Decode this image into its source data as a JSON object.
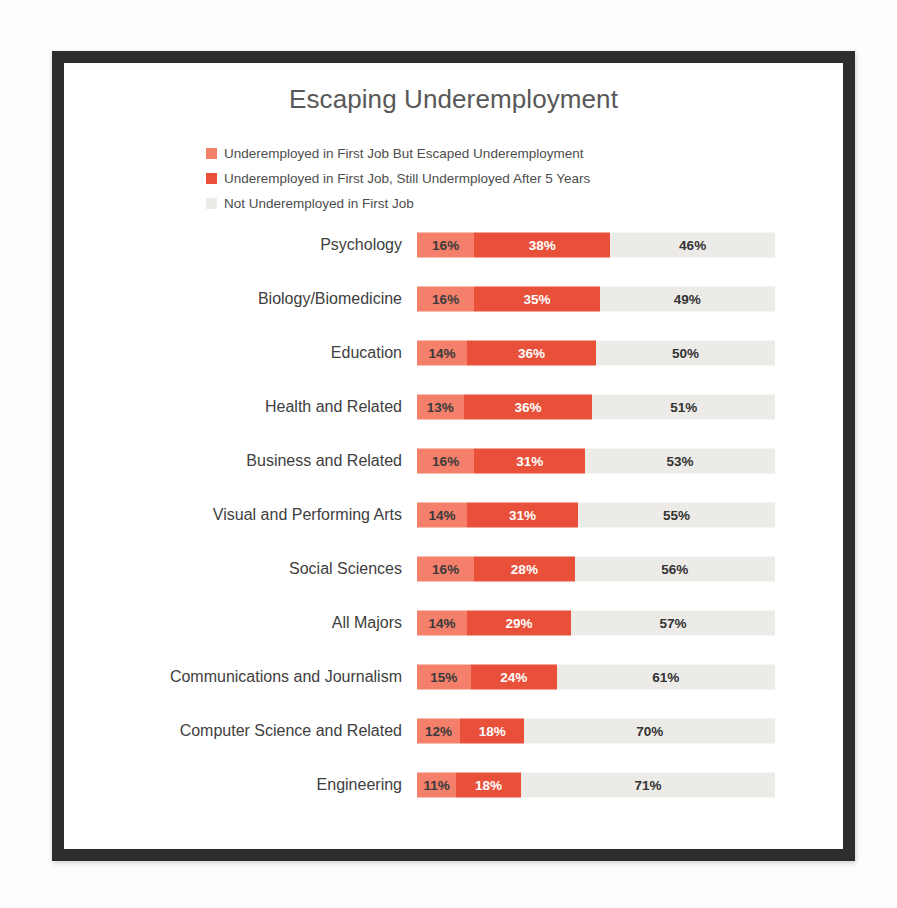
{
  "chart_data": {
    "type": "bar",
    "subtype": "stacked-horizontal-100",
    "title": "Escaping Underemployment",
    "xlabel": "",
    "ylabel": "",
    "xlim": [
      0,
      100
    ],
    "grid": false,
    "legend_position": "top-left",
    "value_suffix": "%",
    "colors": {
      "escaped": "#f4806c",
      "still": "#e8503a",
      "not": "#edebe8",
      "title_text": "#585858",
      "label_text": "#404040",
      "frame": "#2e2d2e",
      "background": "#ffffff"
    },
    "legend": [
      {
        "label": "Underemployed in First Job But Escaped Underemployment",
        "color": "#f4806c",
        "key": "escaped"
      },
      {
        "label": "Underemployed in First Job, Still Undermployed After 5 Years",
        "color": "#e8503a",
        "key": "still"
      },
      {
        "label": "Not Underemployed in First Job",
        "color": "#edebe8",
        "key": "not"
      }
    ],
    "series": [
      {
        "name": "Underemployed in First Job But Escaped Underemployment",
        "key": "escaped",
        "values": [
          16,
          16,
          14,
          13,
          16,
          14,
          16,
          14,
          15,
          12,
          11
        ]
      },
      {
        "name": "Underemployed in First Job, Still Undermployed After 5 Years",
        "key": "still",
        "values": [
          38,
          35,
          36,
          36,
          31,
          31,
          28,
          29,
          24,
          18,
          18
        ]
      },
      {
        "name": "Not Underemployed in First Job",
        "key": "not",
        "values": [
          46,
          49,
          50,
          51,
          53,
          55,
          56,
          57,
          61,
          70,
          71
        ]
      }
    ],
    "categories": [
      "Psychology",
      "Biology/Biomedicine",
      "Education",
      "Health and Related",
      "Business and Related",
      "Visual and Performing Arts",
      "Social Sciences",
      "All Majors",
      "Communications and Journalism",
      "Computer Science and Related",
      "Engineering"
    ],
    "rows": [
      {
        "category": "Psychology",
        "escaped": 16,
        "still": 38,
        "not": 46,
        "escaped_label": "16%",
        "still_label": "38%",
        "not_label": "46%"
      },
      {
        "category": "Biology/Biomedicine",
        "escaped": 16,
        "still": 35,
        "not": 49,
        "escaped_label": "16%",
        "still_label": "35%",
        "not_label": "49%"
      },
      {
        "category": "Education",
        "escaped": 14,
        "still": 36,
        "not": 50,
        "escaped_label": "14%",
        "still_label": "36%",
        "not_label": "50%"
      },
      {
        "category": "Health and Related",
        "escaped": 13,
        "still": 36,
        "not": 51,
        "escaped_label": "13%",
        "still_label": "36%",
        "not_label": "51%"
      },
      {
        "category": "Business and Related",
        "escaped": 16,
        "still": 31,
        "not": 53,
        "escaped_label": "16%",
        "still_label": "31%",
        "not_label": "53%"
      },
      {
        "category": "Visual and Performing Arts",
        "escaped": 14,
        "still": 31,
        "not": 55,
        "escaped_label": "14%",
        "still_label": "31%",
        "not_label": "55%"
      },
      {
        "category": "Social Sciences",
        "escaped": 16,
        "still": 28,
        "not": 56,
        "escaped_label": "16%",
        "still_label": "28%",
        "not_label": "56%"
      },
      {
        "category": "All Majors",
        "escaped": 14,
        "still": 29,
        "not": 57,
        "escaped_label": "14%",
        "still_label": "29%",
        "not_label": "57%"
      },
      {
        "category": "Communications and Journalism",
        "escaped": 15,
        "still": 24,
        "not": 61,
        "escaped_label": "15%",
        "still_label": "24%",
        "not_label": "61%"
      },
      {
        "category": "Computer Science and Related",
        "escaped": 12,
        "still": 18,
        "not": 70,
        "escaped_label": "12%",
        "still_label": "18%",
        "not_label": "70%"
      },
      {
        "category": "Engineering",
        "escaped": 11,
        "still": 18,
        "not": 71,
        "escaped_label": "11%",
        "still_label": "18%",
        "not_label": "71%"
      }
    ]
  }
}
